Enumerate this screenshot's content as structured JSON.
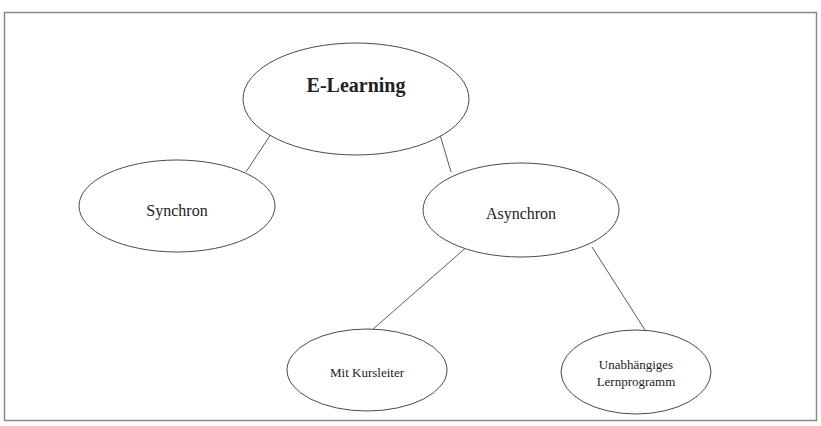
{
  "diagram": {
    "type": "tree",
    "nodes": [
      {
        "id": "root",
        "label": "E-Learning",
        "cx": 356,
        "cy": 99,
        "rx": 113,
        "ry": 56,
        "bold": true
      },
      {
        "id": "sync",
        "label": "Synchron",
        "cx": 177,
        "cy": 206,
        "rx": 98,
        "ry": 46
      },
      {
        "id": "async",
        "label": "Asynchron",
        "cx": 521,
        "cy": 210,
        "rx": 98,
        "ry": 47
      },
      {
        "id": "mit",
        "label": "Mit Kursleiter",
        "cx": 367,
        "cy": 370,
        "rx": 80,
        "ry": 41
      },
      {
        "id": "unab",
        "label_line1": "Unabhängiges",
        "label_line2": "Lernprogramm",
        "cx": 636,
        "cy": 372,
        "rx": 75,
        "ry": 42
      }
    ],
    "edges": [
      {
        "from": "root",
        "to": "sync"
      },
      {
        "from": "root",
        "to": "async"
      },
      {
        "from": "async",
        "to": "mit"
      },
      {
        "from": "async",
        "to": "unab"
      }
    ]
  },
  "labels": {
    "root": "E-Learning",
    "sync": "Synchron",
    "async": "Asynchron",
    "mit": "Mit Kursleiter",
    "unab_line1": "Unabhängiges",
    "unab_line2": "Lernprogramm"
  }
}
